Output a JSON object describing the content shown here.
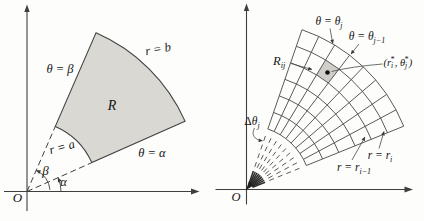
{
  "colors": {
    "line": "#3f3f3f",
    "grid": "#474747",
    "hub": "#2d2d2d",
    "fill": "#d9d8d3",
    "cell_fill": "#cfcec8",
    "leader": "#4a4a4a",
    "text": "#141414",
    "background": "#fdfdfc"
  },
  "left_panel": {
    "origin": "O",
    "theta_beta": "θ = β",
    "r_b": "r = b",
    "region": "R",
    "r_a": "r = a",
    "theta_alpha": "θ = α",
    "beta": "β",
    "alpha": "α"
  },
  "right_panel": {
    "origin": "O",
    "theta_j": {
      "main": "θ = θ",
      "sub": "j"
    },
    "theta_j_minus_1": {
      "main": "θ = θ",
      "sub": "j−1"
    },
    "R_ij": {
      "main": "R",
      "sub": "ij"
    },
    "sample_point": {
      "open": "(r",
      "sub_i": "i",
      "star_i": "*",
      "comma_theta": ", θ",
      "sub_j": "j",
      "star_j": "*",
      "close": ")"
    },
    "delta_theta": {
      "delta": "Δ",
      "theta": "θ",
      "sub": "j"
    },
    "r_i": {
      "main": "r = r",
      "sub": "i"
    },
    "r_i_minus_1": {
      "main": "r = r",
      "sub": "i−1"
    }
  }
}
